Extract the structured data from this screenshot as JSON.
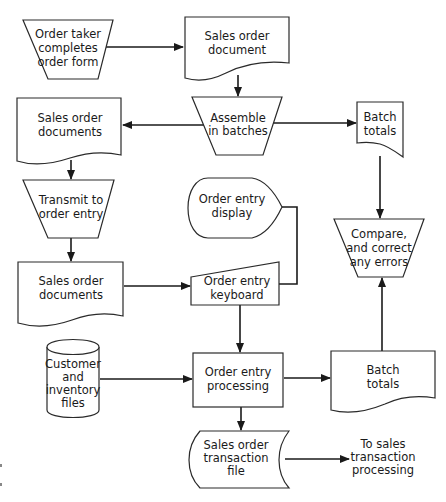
{
  "diagram": {
    "type": "flowchart",
    "nodes": [
      {
        "id": "order_taker",
        "shape": "manual-operation",
        "lines": [
          "Order taker",
          "completes",
          "order form"
        ]
      },
      {
        "id": "sales_order_document",
        "shape": "document",
        "lines": [
          "Sales order",
          "document"
        ]
      },
      {
        "id": "assemble_batches",
        "shape": "manual-operation",
        "lines": [
          "Assemble",
          "in batches"
        ]
      },
      {
        "id": "sales_order_documents_1",
        "shape": "document",
        "lines": [
          "Sales order",
          "documents"
        ]
      },
      {
        "id": "batch_totals_1",
        "shape": "document-curled",
        "lines": [
          "Batch",
          "totals"
        ]
      },
      {
        "id": "transmit_order_entry",
        "shape": "manual-operation",
        "lines": [
          "Transmit to",
          "order entry"
        ]
      },
      {
        "id": "order_entry_display",
        "shape": "display",
        "lines": [
          "Order entry",
          "display"
        ]
      },
      {
        "id": "compare_correct",
        "shape": "manual-operation",
        "lines": [
          "Compare,",
          "and correct",
          "any errors"
        ]
      },
      {
        "id": "sales_order_documents_2",
        "shape": "document",
        "lines": [
          "Sales order",
          "documents"
        ]
      },
      {
        "id": "order_entry_keyboard",
        "shape": "manual-input",
        "lines": [
          "Order entry",
          "keyboard"
        ]
      },
      {
        "id": "customer_inventory_files",
        "shape": "database",
        "lines": [
          "Customer",
          "and",
          "inventory",
          "files"
        ]
      },
      {
        "id": "order_entry_processing",
        "shape": "process",
        "lines": [
          "Order entry",
          "processing"
        ]
      },
      {
        "id": "batch_totals_2",
        "shape": "document",
        "lines": [
          "Batch",
          "totals"
        ]
      },
      {
        "id": "sales_order_transaction_file",
        "shape": "stored-data",
        "lines": [
          "Sales order",
          "transaction",
          "file"
        ]
      },
      {
        "id": "to_sales_transaction",
        "shape": "text",
        "lines": [
          "To sales",
          "transaction",
          "processing"
        ]
      }
    ],
    "edges": [
      {
        "from": "order_taker",
        "to": "sales_order_document"
      },
      {
        "from": "sales_order_document",
        "to": "assemble_batches"
      },
      {
        "from": "assemble_batches",
        "to": "sales_order_documents_1"
      },
      {
        "from": "assemble_batches",
        "to": "batch_totals_1"
      },
      {
        "from": "sales_order_documents_1",
        "to": "transmit_order_entry"
      },
      {
        "from": "transmit_order_entry",
        "to": "sales_order_documents_2"
      },
      {
        "from": "batch_totals_1",
        "to": "compare_correct"
      },
      {
        "from": "order_entry_display",
        "to": "order_entry_keyboard",
        "arrow": false
      },
      {
        "from": "sales_order_documents_2",
        "to": "order_entry_keyboard"
      },
      {
        "from": "order_entry_keyboard",
        "to": "order_entry_processing"
      },
      {
        "from": "customer_inventory_files",
        "to": "order_entry_processing"
      },
      {
        "from": "order_entry_processing",
        "to": "batch_totals_2"
      },
      {
        "from": "batch_totals_2",
        "to": "compare_correct"
      },
      {
        "from": "order_entry_processing",
        "to": "sales_order_transaction_file"
      },
      {
        "from": "sales_order_transaction_file",
        "to": "to_sales_transaction"
      }
    ]
  },
  "labels": {
    "order_taker": [
      "Order taker",
      "completes",
      "order form"
    ],
    "sales_order_document": [
      "Sales order",
      "document"
    ],
    "assemble_batches": [
      "Assemble",
      "in batches"
    ],
    "sales_order_documents_1": [
      "Sales order",
      "documents"
    ],
    "batch_totals_1": [
      "Batch",
      "totals"
    ],
    "transmit_order_entry": [
      "Transmit to",
      "order entry"
    ],
    "order_entry_display": [
      "Order entry",
      "display"
    ],
    "compare_correct": [
      "Compare,",
      "and correct",
      "any errors"
    ],
    "sales_order_documents_2": [
      "Sales order",
      "documents"
    ],
    "order_entry_keyboard": [
      "Order entry",
      "keyboard"
    ],
    "customer_inventory_files": [
      "Customer",
      "and",
      "inventory",
      "files"
    ],
    "order_entry_processing": [
      "Order entry",
      "processing"
    ],
    "batch_totals_2": [
      "Batch",
      "totals"
    ],
    "sales_order_transaction_file": [
      "Sales order",
      "transaction",
      "file"
    ],
    "to_sales_transaction": [
      "To sales",
      "transaction",
      "processing"
    ]
  },
  "colors": {
    "stroke": "#2a2a2a",
    "fill": "#ffffff",
    "text": "#1a1a1a",
    "background": "#ffffff"
  }
}
